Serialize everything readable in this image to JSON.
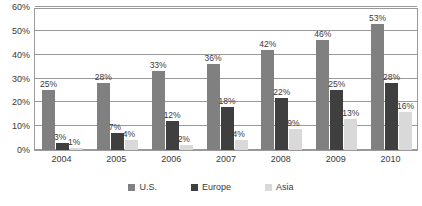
{
  "chart_data": {
    "type": "bar",
    "title": "",
    "subtitle": "",
    "xlabel": "",
    "ylabel": "",
    "ylim": [
      0,
      60
    ],
    "grid": true,
    "legend_position": "bottom",
    "categories": [
      "2004",
      "2005",
      "2006",
      "2007",
      "2008",
      "2009",
      "2010"
    ],
    "ytick_labels": [
      "0%",
      "10%",
      "20%",
      "30%",
      "40%",
      "50%",
      "60%"
    ],
    "ytick_values": [
      0,
      10,
      20,
      30,
      40,
      50,
      60
    ],
    "series": [
      {
        "name": "U.S.",
        "color": "#808080",
        "values": [
          25,
          28,
          33,
          36,
          42,
          46,
          53
        ],
        "labels": [
          "25%",
          "28%",
          "33%",
          "36%",
          "42%",
          "46%",
          "53%"
        ]
      },
      {
        "name": "Europe",
        "color": "#3f3f3f",
        "values": [
          3,
          7,
          12,
          18,
          22,
          25,
          28
        ],
        "labels": [
          "3%",
          "7%",
          "12%",
          "18%",
          "22%",
          "25%",
          "28%"
        ]
      },
      {
        "name": "Asia",
        "color": "#d9d9d9",
        "values": [
          1,
          4,
          2,
          4,
          9,
          13,
          16
        ],
        "labels": [
          "1%",
          "4%",
          "2%",
          "4%",
          "9%",
          "13%",
          "16%"
        ]
      }
    ]
  },
  "legend": {
    "items": [
      {
        "label": "U.S.",
        "color": "#808080"
      },
      {
        "label": "Europe",
        "color": "#3f3f3f"
      },
      {
        "label": "Asia",
        "color": "#d9d9d9"
      }
    ]
  }
}
